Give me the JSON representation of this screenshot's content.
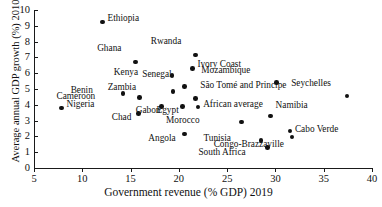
{
  "chart_data": {
    "type": "scatter",
    "title": "",
    "xlabel": "Government revenue (% GDP) 2019",
    "ylabel": "Average annual GDP growth (%) 2010–19",
    "xlim": [
      5,
      40
    ],
    "ylim": [
      0,
      10
    ],
    "xticks": [
      5,
      10,
      15,
      20,
      25,
      30,
      35,
      40
    ],
    "yticks": [
      0,
      1,
      2,
      3,
      4,
      5,
      6,
      7,
      8,
      9,
      10
    ],
    "xticklabels": [
      "5",
      "10",
      "15",
      "20",
      "25",
      "30",
      "35",
      "40"
    ],
    "yticklabels": [
      "0",
      "1",
      "2",
      "3",
      "4",
      "5",
      "6",
      "7",
      "8",
      "9",
      "10"
    ],
    "grid": false,
    "legend": null,
    "marker": "filled-circle",
    "marker_color": "#111111",
    "points": [
      {
        "label": "Ethiopia",
        "x": 12.1,
        "y": 9.25,
        "lx": 5,
        "ly": -5
      },
      {
        "label": "Ghana",
        "x": 15.5,
        "y": 6.7,
        "lx": -14,
        "ly": -15
      },
      {
        "label": "Rwanda",
        "x": 21.7,
        "y": 7.15,
        "lx": -14,
        "ly": -15
      },
      {
        "label": "Kenya",
        "x": 19.3,
        "y": 5.85,
        "lx": -34,
        "ly": -5
      },
      {
        "label": "Ivory Coast",
        "x": 21.4,
        "y": 6.3,
        "lx": 5,
        "ly": -5
      },
      {
        "label": "Senegal",
        "x": 20.6,
        "y": 5.15,
        "lx": -13,
        "ly": -14
      },
      {
        "label": "Zambia",
        "x": 19.4,
        "y": 4.85,
        "lx": -37,
        "ly": -5
      },
      {
        "label": "Benin",
        "x": 14.2,
        "y": 4.7,
        "lx": -30,
        "ly": -5
      },
      {
        "label": "São Tomé and Principe",
        "x": 21.7,
        "y": 4.4,
        "lx": 5,
        "ly": -14
      },
      {
        "label": "African average",
        "x": 22.0,
        "y": 3.85,
        "lx": 5,
        "ly": -4
      },
      {
        "label": "Cameroon",
        "x": 15.9,
        "y": 4.45,
        "lx": -44,
        "ly": -3
      },
      {
        "label": "Gabon",
        "x": 18.2,
        "y": 3.9,
        "lx": -1,
        "ly": 3
      },
      {
        "label": "Egypt",
        "x": 20.4,
        "y": 3.9,
        "lx": -4,
        "ly": 3
      },
      {
        "label": "Chad",
        "x": 15.8,
        "y": 3.45,
        "lx": -7,
        "ly": 3
      },
      {
        "label": "Nigeria",
        "x": 7.85,
        "y": 3.8,
        "lx": 5,
        "ly": -5
      },
      {
        "label": "Angola",
        "x": 20.6,
        "y": 2.15,
        "lx": -9,
        "ly": 3
      },
      {
        "label": "Mozambique",
        "x": 30.1,
        "y": 5.4,
        "lx": -26,
        "ly": -14
      },
      {
        "label": "Seychelles",
        "x": 37.4,
        "y": 4.55,
        "lx": -16,
        "ly": -14
      },
      {
        "label": "Namibia",
        "x": 29.5,
        "y": 3.3,
        "lx": 5,
        "ly": -12
      },
      {
        "label": "Morocco",
        "x": 26.5,
        "y": 2.9,
        "lx": -42,
        "ly": -3
      },
      {
        "language": "",
        "label": "Cabo Verde",
        "x": 31.5,
        "y": 2.35,
        "lx": 5,
        "ly": -3
      },
      {
        "label": "Congo-Brazzaville",
        "x": 31.7,
        "y": 1.95,
        "lx": -8,
        "ly": 6
      },
      {
        "label": "Tunisia",
        "x": 28.5,
        "y": 1.75,
        "lx": -30,
        "ly": -3
      },
      {
        "label": "South Africa",
        "x": 29.2,
        "y": 1.3,
        "lx": -22,
        "ly": 4
      }
    ]
  }
}
